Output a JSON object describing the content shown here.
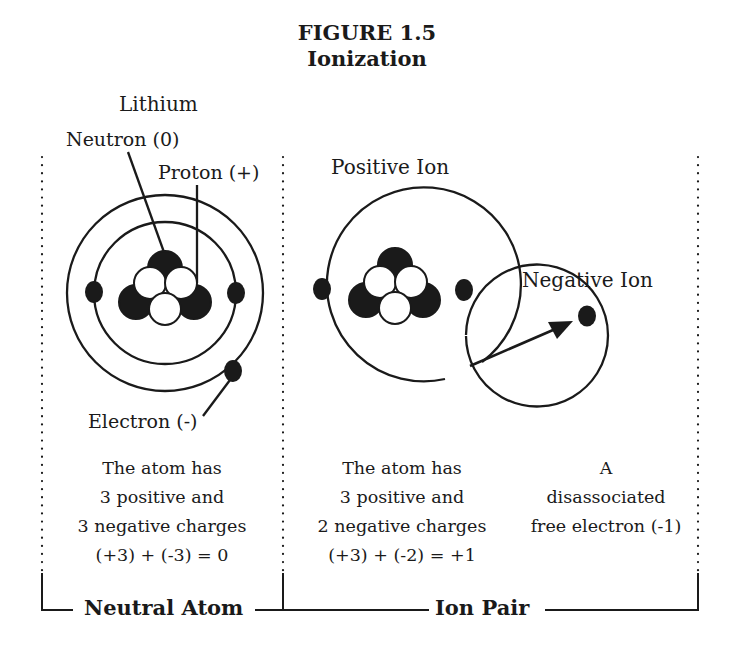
{
  "figure": {
    "number": "FIGURE 1.5",
    "title": "Ionization"
  },
  "left_panel": {
    "atom_label": "Lithium",
    "neutron_label": "Neutron (0)",
    "proton_label": "Proton (+)",
    "electron_label": "Electron (-)",
    "description": [
      "The atom has",
      "3 positive and",
      "3 negative charges",
      "(+3) + (-3) = 0"
    ],
    "bracket_label": "Neutral Atom"
  },
  "middle_panel": {
    "atom_label": "Positive Ion",
    "description": [
      "The atom has",
      "3 positive and",
      "2 negative charges",
      "(+3) + (-2) = +1"
    ]
  },
  "right_panel": {
    "ion_label": "Negative Ion",
    "description": [
      "A",
      "disassociated",
      "free electron (-1)"
    ]
  },
  "ion_pair_bracket_label": "Ion Pair",
  "colors": {
    "ink": "#1a1a1a",
    "background": "#ffffff"
  }
}
